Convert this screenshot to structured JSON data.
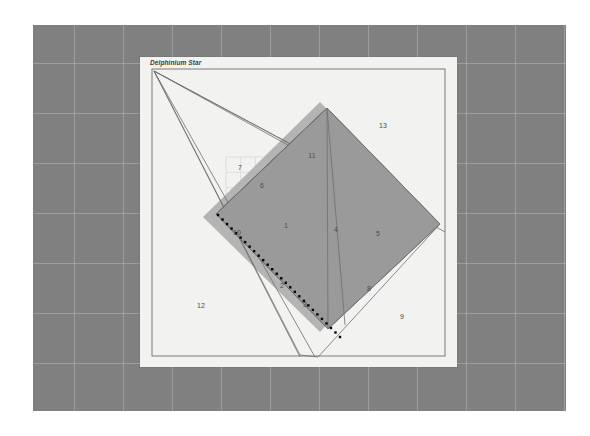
{
  "canvas": {
    "width": 590,
    "height": 436,
    "background_color": "#ffffff"
  },
  "gray_panel": {
    "name": "desktop-backdrop",
    "color": "#808080",
    "grid_color": "#a0a0a0",
    "grid_spacing": 50,
    "x": 33,
    "y": 25,
    "width": 533,
    "height": 386
  },
  "card": {
    "title": "Delphinium Star",
    "background_color": "#f2f2f0",
    "x": 140,
    "y": 57,
    "width": 317,
    "height": 310,
    "border_color": "#6e6e6e"
  },
  "chart_data": {
    "type": "diagram",
    "title": "Delphinium Star",
    "subtype": "rotated-rectangle-triangulation",
    "colors": {
      "fill_primary": "#9a9a9a",
      "fill_secondary": "#a8a8a8",
      "shadow": "#b4b4b4",
      "stroke": "#6e6e6e",
      "dotted": "#000000",
      "label": "#4a4a4a"
    },
    "inner_frame": {
      "x": 12,
      "y": 12,
      "width": 293,
      "height": 287,
      "stroke": "#6e6e6e"
    },
    "shadow_polygon": [
      [
        63,
        160
      ],
      [
        180,
        45
      ],
      [
        290,
        160
      ],
      [
        180,
        275
      ]
    ],
    "main_quad": [
      [
        76,
        157
      ],
      [
        187,
        51
      ],
      [
        300,
        167
      ],
      [
        188,
        272
      ]
    ],
    "apex": [
      14,
      14
    ],
    "fan_lines": [
      {
        "from": [
          14,
          14
        ],
        "to": [
          300,
          167
        ],
        "name": "fan-line-a"
      },
      {
        "from": [
          14,
          14
        ],
        "to": [
          305,
          175
        ],
        "name": "fan-line-b"
      },
      {
        "from": [
          14,
          14
        ],
        "to": [
          160,
          300
        ],
        "name": "fan-line-c"
      },
      {
        "from": [
          14,
          14
        ],
        "to": [
          175,
          300
        ],
        "name": "fan-line-d"
      }
    ],
    "long_quad": [
      [
        14,
        14
      ],
      [
        300,
        167
      ],
      [
        178,
        300
      ],
      [
        160,
        298
      ]
    ],
    "triangulation_edges": [
      {
        "from": [
          76,
          157
        ],
        "to": [
          187,
          51
        ],
        "name": "edge-6"
      },
      {
        "from": [
          187,
          51
        ],
        "to": [
          300,
          167
        ],
        "name": "edge-upper-right"
      },
      {
        "from": [
          300,
          167
        ],
        "to": [
          188,
          272
        ],
        "name": "edge-lower-right"
      },
      {
        "from": [
          188,
          272
        ],
        "to": [
          76,
          157
        ],
        "name": "edge-2"
      },
      {
        "from": [
          187,
          51
        ],
        "to": [
          188,
          272
        ],
        "name": "edge-4-diagonal"
      },
      {
        "from": [
          187,
          51
        ],
        "to": [
          205,
          268
        ],
        "name": "edge-4-second"
      },
      {
        "from": [
          76,
          157
        ],
        "to": [
          187,
          51
        ],
        "name": "edge-1-left"
      }
    ],
    "dotted_line": {
      "from": [
        78,
        158
      ],
      "to": [
        200,
        280
      ],
      "dot_count": 28,
      "dot_size": 2.4,
      "color": "#000000",
      "name": "dotted-baseline"
    },
    "labels": [
      {
        "id": "1",
        "x": 146,
        "y": 168,
        "region": "interior-center"
      },
      {
        "id": "2",
        "x": 142,
        "y": 228,
        "region": "interior-lower"
      },
      {
        "id": "3",
        "x": 165,
        "y": 247,
        "region": "exterior-bottom"
      },
      {
        "id": "4",
        "x": 196,
        "y": 172,
        "region": "interior-right"
      },
      {
        "id": "5",
        "x": 238,
        "y": 176,
        "region": "interior-far-right"
      },
      {
        "id": "6",
        "x": 122,
        "y": 128,
        "region": "interior-upper-left"
      },
      {
        "id": "7",
        "x": 100,
        "y": 110,
        "region": "exterior-upper-left"
      },
      {
        "id": "8",
        "x": 229,
        "y": 231,
        "region": "vertex-lower-right"
      },
      {
        "id": "9",
        "x": 262,
        "y": 259,
        "region": "exterior-lower-right"
      },
      {
        "id": "10",
        "x": 97,
        "y": 175,
        "region": "vertex-left"
      },
      {
        "id": "11",
        "x": 172,
        "y": 98,
        "region": "vertex-top"
      },
      {
        "id": "12",
        "x": 61,
        "y": 248,
        "region": "exterior-bottom-left"
      },
      {
        "id": "13",
        "x": 243,
        "y": 68,
        "region": "exterior-upper-right"
      }
    ],
    "faint_grid": {
      "x": 86,
      "y": 100,
      "width": 44,
      "height": 46,
      "lines": 3,
      "color": "#d6d6d4",
      "name": "faint-construction-grid"
    }
  }
}
